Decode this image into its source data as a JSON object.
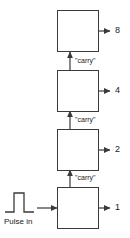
{
  "diagram": {
    "background_color": "#ffffff",
    "line_color": "#3a3a3a",
    "text_color": "#1a1a1a",
    "input": {
      "label": "Pulse in",
      "waveform": "square-pulse"
    },
    "stages": [
      {
        "id": "stage-8",
        "output_label": "8",
        "carry_label": "\"carry\""
      },
      {
        "id": "stage-4",
        "output_label": "4",
        "carry_label": "\"carry\""
      },
      {
        "id": "stage-2",
        "output_label": "2",
        "carry_label": "\"carry\""
      },
      {
        "id": "stage-1",
        "output_label": "1",
        "carry_label": "\"carry\""
      }
    ],
    "carry_labels": {
      "top": "\"carry\"",
      "upper_middle": "\"carry\"",
      "lower_middle": "\"carry\""
    },
    "outputs": {
      "eight": "8",
      "four": "4",
      "two": "2",
      "one": "1"
    }
  }
}
